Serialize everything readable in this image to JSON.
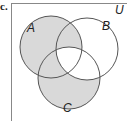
{
  "part_label": "c.",
  "universe_label": "U",
  "sets": [
    {
      "name": "A",
      "cx": 51,
      "cy": 47,
      "r": 31,
      "label_x": 27,
      "label_y": 32
    },
    {
      "name": "B",
      "cx": 87,
      "cy": 49,
      "r": 31,
      "label_x": 103,
      "label_y": 30
    },
    {
      "name": "C",
      "cx": 69,
      "cy": 78,
      "r": 31,
      "label_x": 63,
      "label_y": 112
    }
  ],
  "shaded_regions": [
    "A only",
    "A and B not C",
    "A and C not B",
    "C only"
  ],
  "unshaded_regions": [
    "B only",
    "B and C not A",
    "A and B and C",
    "outside"
  ],
  "colors": {
    "shade": "#d9d9d9",
    "stroke": "#555555",
    "border": "#777777"
  }
}
